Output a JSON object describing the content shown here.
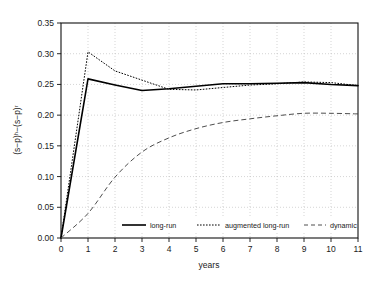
{
  "chart_data": {
    "type": "line",
    "title": "",
    "xlabel": "years",
    "ylabel": "(s−p)ʰ−(s−p)ʳ",
    "xlim": [
      0,
      11
    ],
    "ylim": [
      0.0,
      0.35
    ],
    "grid": true,
    "legend_position": "bottom-center",
    "x_ticks": [
      "0",
      "1",
      "2",
      "3",
      "4",
      "5",
      "6",
      "7",
      "8",
      "9",
      "10",
      "11"
    ],
    "y_ticks": [
      "0.00",
      "0.05",
      "0.10",
      "0.15",
      "0.20",
      "0.25",
      "0.30",
      "0.35"
    ],
    "x": [
      0,
      1,
      2,
      3,
      4,
      5,
      6,
      7,
      8,
      9,
      10,
      11
    ],
    "series": [
      {
        "name": "long-run",
        "style": "solid",
        "color": "#000000",
        "values": [
          0.0,
          0.259,
          0.249,
          0.24,
          0.243,
          0.247,
          0.251,
          0.251,
          0.252,
          0.253,
          0.25,
          0.248
        ]
      },
      {
        "name": "augmented long-run",
        "style": "dotted",
        "color": "#000000",
        "values": [
          0.0,
          0.303,
          0.272,
          0.257,
          0.242,
          0.241,
          0.245,
          0.249,
          0.251,
          0.254,
          0.253,
          0.248
        ]
      },
      {
        "name": "dynamic",
        "style": "dashed",
        "color": "#3a3a3a",
        "values": [
          0.0,
          0.04,
          0.099,
          0.14,
          0.163,
          0.178,
          0.188,
          0.194,
          0.199,
          0.203,
          0.203,
          0.202
        ]
      }
    ]
  },
  "legend": {
    "items": [
      {
        "label": "long-run"
      },
      {
        "label": "augmented long-run"
      },
      {
        "label": "dynamic"
      }
    ]
  },
  "axes": {
    "x_title": "years",
    "y_title": "(s−p)ʰ−(s−p)ʳ"
  }
}
